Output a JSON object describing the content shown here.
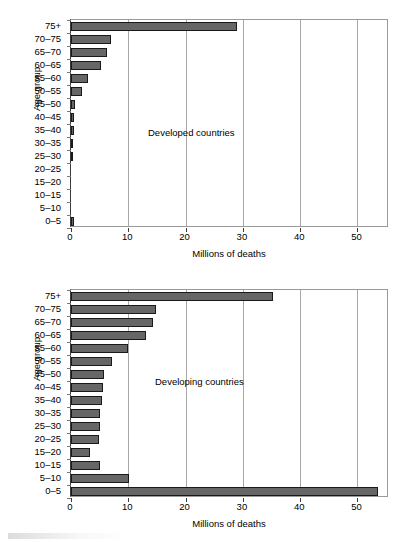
{
  "figure": {
    "axis_title_y": "Age group",
    "axis_title_x": "Millions of deaths",
    "x_ticks": [
      "0",
      "10",
      "20",
      "30",
      "40",
      "50"
    ],
    "x_tick_values": [
      0,
      10,
      20,
      30,
      40,
      50
    ],
    "categories_top_to_bottom": [
      "75+",
      "70–75",
      "65–70",
      "60–65",
      "55–60",
      "50–55",
      "45–50",
      "40–45",
      "35–40",
      "30–35",
      "25–30",
      "20–25",
      "15–20",
      "10–15",
      "5–10",
      "0–5"
    ],
    "bar_fill": "#666666",
    "bar_stroke": "#1a1a1a",
    "grid_color": "#a8a8a8",
    "axis_color": "#3b3b3b"
  },
  "panels": [
    {
      "annotation": "Developed countries"
    },
    {
      "annotation": "Developing countries"
    }
  ],
  "chart_data": [
    {
      "type": "bar",
      "title": "Developed countries",
      "orientation": "horizontal",
      "xlabel": "Millions of deaths",
      "ylabel": "Age group",
      "xlim": [
        0,
        55.5
      ],
      "xticks": [
        0,
        10,
        20,
        30,
        40,
        50
      ],
      "grid": "vertical",
      "legend": "none",
      "categories": [
        "0–5",
        "5–10",
        "10–15",
        "15–20",
        "20–25",
        "25–30",
        "30–35",
        "35–40",
        "40–45",
        "45–50",
        "50–55",
        "55–60",
        "60–65",
        "65–70",
        "70–75",
        "75+"
      ],
      "values": [
        0.5,
        0.0,
        0.0,
        0.0,
        0.0,
        0.2,
        0.4,
        0.6,
        0.6,
        0.7,
        1.9,
        2.9,
        5.2,
        6.2,
        7.0,
        29.0
      ]
    },
    {
      "type": "bar",
      "title": "Developing countries",
      "orientation": "horizontal",
      "xlabel": "Millions of deaths",
      "ylabel": "Age group",
      "xlim": [
        0,
        55.5
      ],
      "xticks": [
        0,
        10,
        20,
        30,
        40,
        50
      ],
      "grid": "vertical",
      "legend": "none",
      "categories": [
        "0–5",
        "5–10",
        "10–15",
        "15–20",
        "20–25",
        "25–30",
        "30–35",
        "35–40",
        "40–45",
        "45–50",
        "50–55",
        "55–60",
        "60–65",
        "65–70",
        "70–75",
        "75+"
      ],
      "values": [
        53.5,
        10.2,
        5.0,
        3.4,
        4.9,
        5.0,
        5.0,
        5.4,
        5.6,
        5.7,
        7.2,
        9.9,
        13.1,
        14.3,
        14.9,
        35.3
      ]
    }
  ]
}
